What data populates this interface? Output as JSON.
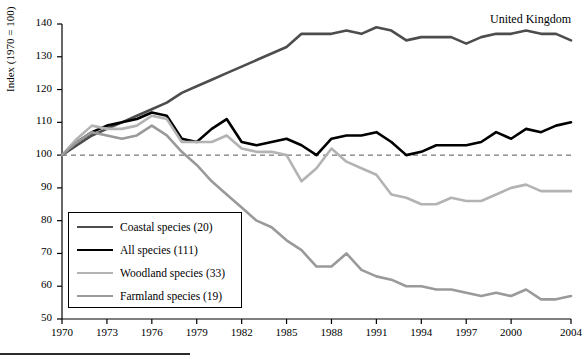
{
  "chart_data": {
    "type": "line",
    "title": "",
    "annotation": "United Kingdom",
    "xlabel": "",
    "ylabel": "Index (1970 = 100)",
    "xlim": [
      1970,
      2004
    ],
    "ylim": [
      50,
      140
    ],
    "grid": false,
    "legend_position": "lower-left",
    "reference_line": 100,
    "xticks": [
      1970,
      1973,
      1976,
      1979,
      1982,
      1985,
      1988,
      1991,
      1994,
      1997,
      2000,
      2004
    ],
    "yticks": [
      50,
      60,
      70,
      80,
      90,
      100,
      110,
      120,
      130,
      140
    ],
    "x": [
      1970,
      1971,
      1972,
      1973,
      1974,
      1975,
      1976,
      1977,
      1978,
      1979,
      1980,
      1981,
      1982,
      1983,
      1984,
      1985,
      1986,
      1987,
      1988,
      1989,
      1990,
      1991,
      1992,
      1993,
      1994,
      1995,
      1996,
      1997,
      1998,
      1999,
      2000,
      2001,
      2002,
      2003,
      2004
    ],
    "series": [
      {
        "name": "Coastal species (20)",
        "color": "#4d4d4d",
        "width": 2.6,
        "values": [
          100,
          103,
          106,
          108,
          110,
          112,
          114,
          116,
          119,
          121,
          123,
          125,
          127,
          129,
          131,
          133,
          137,
          137,
          137,
          138,
          137,
          139,
          138,
          135,
          136,
          136,
          136,
          134,
          136,
          137,
          137,
          138,
          137,
          137,
          135
        ]
      },
      {
        "name": "All species (111)",
        "color": "#000000",
        "width": 2.6,
        "values": [
          100,
          104,
          107,
          109,
          110,
          111,
          113,
          112,
          105,
          104,
          108,
          111,
          104,
          103,
          104,
          105,
          103,
          100,
          105,
          106,
          106,
          107,
          104,
          100,
          101,
          103,
          103,
          103,
          104,
          107,
          105,
          108,
          107,
          109,
          110
        ]
      },
      {
        "name": "Woodland species (33)",
        "color": "#b3b3b3",
        "width": 2.6,
        "values": [
          100,
          105,
          109,
          108,
          108,
          109,
          112,
          111,
          104,
          104,
          104,
          106,
          102,
          101,
          101,
          100,
          92,
          96,
          102,
          98,
          96,
          94,
          88,
          87,
          85,
          85,
          87,
          86,
          86,
          88,
          90,
          91,
          89,
          89,
          89
        ]
      },
      {
        "name": "Farmland species (19)",
        "color": "#9a9a9a",
        "width": 2.6,
        "values": [
          100,
          104,
          107,
          106,
          105,
          106,
          109,
          106,
          101,
          97,
          92,
          88,
          84,
          80,
          78,
          74,
          71,
          66,
          66,
          70,
          65,
          63,
          62,
          60,
          60,
          59,
          59,
          58,
          57,
          58,
          57,
          59,
          56,
          56,
          57
        ]
      }
    ]
  }
}
